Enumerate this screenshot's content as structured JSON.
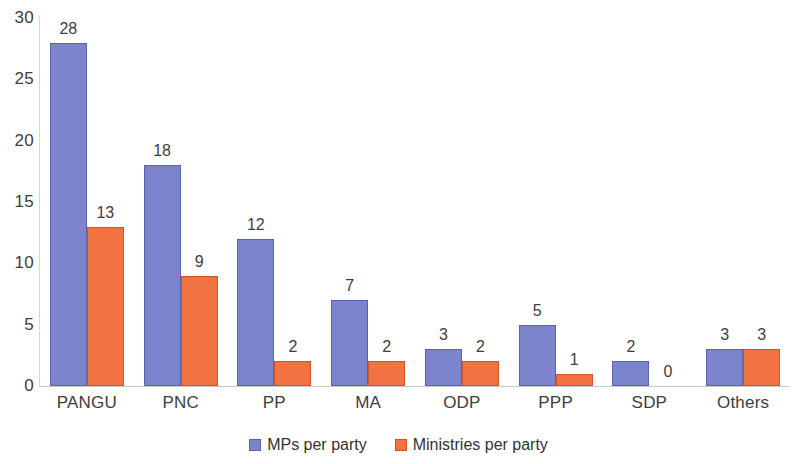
{
  "chart_data": {
    "type": "bar",
    "title": "",
    "subtitle": "",
    "xlabel": "",
    "ylabel": "",
    "ylim": [
      0,
      30
    ],
    "yticks": [
      0,
      5,
      10,
      15,
      20,
      25,
      30
    ],
    "ytick_labels": [
      "0",
      "5",
      "10",
      "15",
      "20",
      "25",
      "30"
    ],
    "grid": false,
    "legend_position": "bottom",
    "categories": [
      "PANGU",
      "PNC",
      "PP",
      "MA",
      "ODP",
      "PPP",
      "SDP",
      "Others"
    ],
    "series": [
      {
        "name": "MPs per party",
        "color": "#7b84cc",
        "values": [
          28,
          18,
          12,
          7,
          3,
          5,
          2,
          3
        ],
        "labels": [
          "28",
          "18",
          "12",
          "7",
          "3",
          "5",
          "2",
          "3"
        ]
      },
      {
        "name": "Ministries per party",
        "color": "#f27242",
        "values": [
          13,
          9,
          2,
          2,
          2,
          1,
          0,
          3
        ],
        "labels": [
          "13",
          "9",
          "2",
          "2",
          "2",
          "1",
          "0",
          "3"
        ]
      }
    ]
  },
  "legend": {
    "items": [
      {
        "label": "MPs per party"
      },
      {
        "label": "Ministries per party"
      }
    ]
  },
  "axis": {
    "y_ticks": [
      "0",
      "5",
      "10",
      "15",
      "20",
      "25",
      "30"
    ],
    "x_ticks": [
      "PANGU",
      "PNC",
      "PP",
      "MA",
      "ODP",
      "PPP",
      "SDP",
      "Others"
    ]
  }
}
